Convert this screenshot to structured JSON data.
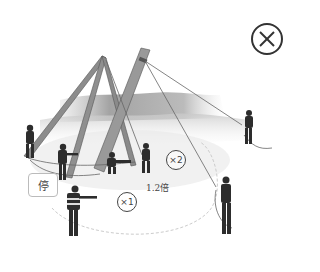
{
  "scene": {
    "description": "Pole erection with gin pole tripod; workers hold guy ropes; safety distance zone",
    "colors": {
      "background": "#ffffff",
      "pole": "#8a8a8a",
      "pole_edge": "#5a5a5a",
      "hill": "#9a9a9a",
      "worker": "#2b2b2b",
      "rope": "#777777",
      "zone": "#dddddd"
    }
  },
  "close_button": {
    "icon": "circle-x-icon",
    "label": "⊗"
  },
  "stop_sign": {
    "text": "停"
  },
  "badges": {
    "x2": "×2",
    "x1": "×1"
  },
  "distance_label": "1.2倍"
}
